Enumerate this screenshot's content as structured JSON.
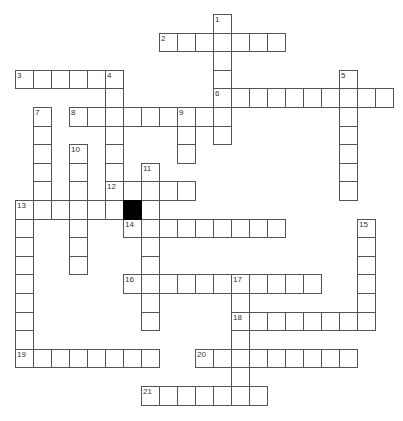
{
  "puzzle": {
    "type": "crossword",
    "grid_origin": {
      "x": 15,
      "y": 14
    },
    "cell_w": 18,
    "cell_h": 18.6,
    "colors": {
      "border": "#555555",
      "fill": "#ffffff",
      "block": "#000000"
    },
    "black_cells": [
      [
        6,
        10
      ]
    ],
    "entries": [
      {
        "number": "1",
        "dir": "down",
        "col": 11,
        "row": 0,
        "length": 7
      },
      {
        "number": "2",
        "dir": "across",
        "col": 8,
        "row": 1,
        "length": 7
      },
      {
        "number": "3",
        "dir": "across",
        "col": 0,
        "row": 3,
        "length": 6
      },
      {
        "number": "4",
        "dir": "down",
        "col": 5,
        "row": 3,
        "length": 8
      },
      {
        "number": "5",
        "dir": "down",
        "col": 18,
        "row": 3,
        "length": 7
      },
      {
        "number": "6",
        "dir": "across",
        "col": 11,
        "row": 4,
        "length": 10
      },
      {
        "number": "7",
        "dir": "down",
        "col": 1,
        "row": 5,
        "length": 6
      },
      {
        "number": "8",
        "dir": "across",
        "col": 3,
        "row": 5,
        "length": 9
      },
      {
        "number": "9",
        "dir": "down",
        "col": 9,
        "row": 5,
        "length": 3
      },
      {
        "number": "10",
        "dir": "down",
        "col": 3,
        "row": 7,
        "length": 7
      },
      {
        "number": "11",
        "dir": "down",
        "col": 7,
        "row": 8,
        "length": 9
      },
      {
        "number": "12",
        "dir": "across",
        "col": 5,
        "row": 9,
        "length": 5
      },
      {
        "number": "13",
        "dir": "across",
        "col": 0,
        "row": 10,
        "length": 6
      },
      {
        "number": "13",
        "dir": "down",
        "col": 0,
        "row": 10,
        "length": 9
      },
      {
        "number": "14",
        "dir": "across",
        "col": 6,
        "row": 11,
        "length": 9
      },
      {
        "number": "15",
        "dir": "down",
        "col": 19,
        "row": 11,
        "length": 6
      },
      {
        "number": "16",
        "dir": "across",
        "col": 6,
        "row": 14,
        "length": 11
      },
      {
        "number": "17",
        "dir": "down",
        "col": 12,
        "row": 14,
        "length": 7
      },
      {
        "number": "18",
        "dir": "across",
        "col": 12,
        "row": 16,
        "length": 8
      },
      {
        "number": "19",
        "dir": "across",
        "col": 0,
        "row": 18,
        "length": 8
      },
      {
        "number": "20",
        "dir": "across",
        "col": 10,
        "row": 18,
        "length": 9
      },
      {
        "number": "21",
        "dir": "across",
        "col": 7,
        "row": 20,
        "length": 7
      }
    ]
  }
}
